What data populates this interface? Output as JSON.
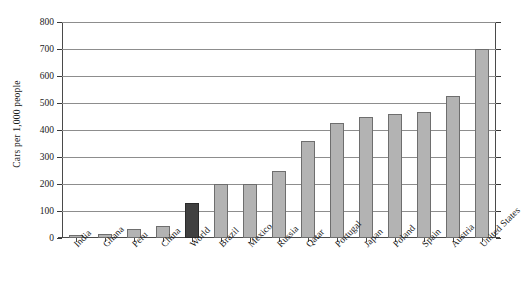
{
  "chart_data": {
    "type": "bar",
    "title": "",
    "xlabel": "",
    "ylabel": "Cars per 1,000 people",
    "ylim": [
      0,
      800
    ],
    "yticks": [
      0,
      100,
      200,
      300,
      400,
      500,
      600,
      700,
      800
    ],
    "ytick_labels": [
      "0",
      "100",
      "200",
      "300",
      "400",
      "500",
      "600",
      "700",
      "800"
    ],
    "grid": true,
    "legend": false,
    "categories": [
      "India",
      "Ghana",
      "Peru",
      "China",
      "World",
      "Brazil",
      "Mexico",
      "Russia",
      "Qatar",
      "Portugal",
      "Japan",
      "Poland",
      "Spain",
      "Austria",
      "United States"
    ],
    "values": [
      12,
      15,
      35,
      45,
      130,
      200,
      200,
      250,
      360,
      425,
      450,
      460,
      465,
      525,
      700
    ],
    "highlight_category": "World",
    "colors": {
      "bar_fill": "#b3b3b3",
      "bar_edge": "#6e6e6e",
      "highlight_fill": "#404040",
      "highlight_edge": "#2a2a2a",
      "grid": "#8d8d8d",
      "axis": "#4a4a4a",
      "text": "#1a1a1a",
      "background": "#ffffff"
    }
  }
}
